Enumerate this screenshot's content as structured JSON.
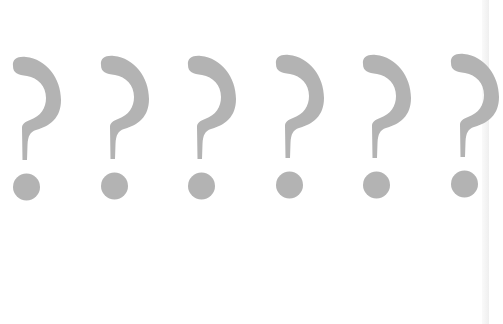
{
  "image": {
    "description": "Row of six large gray question marks on a white background",
    "background_color": "#ffffff",
    "mark_color": "#b3b3b3",
    "edge_color": "#efefef",
    "glyph": "?",
    "count": 6
  },
  "marks": [
    {
      "label": "?",
      "x": 0,
      "y": 0
    },
    {
      "label": "?",
      "x": 88,
      "y": -1
    },
    {
      "label": "?",
      "x": 175,
      "y": -1
    },
    {
      "label": "?",
      "x": 263,
      "y": -2
    },
    {
      "label": "?",
      "x": 350,
      "y": -2
    },
    {
      "label": "?",
      "x": 438,
      "y": -3
    }
  ]
}
